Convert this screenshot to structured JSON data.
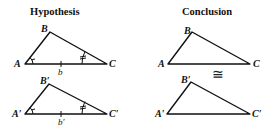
{
  "titles": {
    "hypothesis": "Hypothesis",
    "conclusion": "Conclusion"
  },
  "hypothesis": {
    "triangle1": {
      "A": "A",
      "B": "B",
      "C": "C",
      "side": "b"
    },
    "triangle2": {
      "A": "A′",
      "B": "B′",
      "C": "C′",
      "side": "b′"
    }
  },
  "conclusion": {
    "triangle1": {
      "A": "A",
      "B": "B",
      "C": "C"
    },
    "triangle2": {
      "A": "A′",
      "B": "B′",
      "C": "C′"
    },
    "relation": "≅"
  },
  "colors": {
    "stroke": "#111111",
    "background": "#ffffff"
  }
}
